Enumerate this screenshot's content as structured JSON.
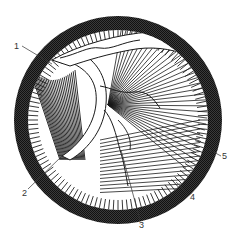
{
  "figure": {
    "type": "anatomical-line-illustration",
    "colors": {
      "ring": "#2a2a2a",
      "ink": "#1a1a1a",
      "paper": "#ffffff",
      "label": "#333333"
    }
  },
  "labels": [
    {
      "id": "1",
      "text": "1",
      "x": 14,
      "y": 42
    },
    {
      "id": "2",
      "text": "2",
      "x": 22,
      "y": 189
    },
    {
      "id": "3",
      "text": "3",
      "x": 139,
      "y": 221
    },
    {
      "id": "4",
      "text": "4",
      "x": 190,
      "y": 193
    },
    {
      "id": "5",
      "text": "5",
      "x": 222,
      "y": 152
    }
  ]
}
